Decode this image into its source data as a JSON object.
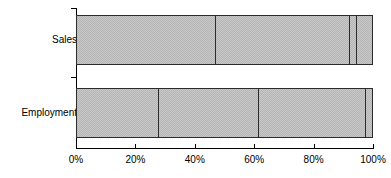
{
  "chart_data": {
    "type": "bar",
    "orientation": "horizontal",
    "stacked": true,
    "normalized": "100%",
    "title": "",
    "subtitle": "",
    "xlabel": "",
    "ylabel": "",
    "categories": [
      "Sales",
      "Employment"
    ],
    "xlim": [
      0,
      100
    ],
    "xticks": [
      0,
      20,
      40,
      60,
      80,
      100
    ],
    "xtick_labels": [
      "0%",
      "20%",
      "40%",
      "60%",
      "80%",
      "100%"
    ],
    "grid": false,
    "legend": null,
    "legend_position": "none",
    "annotations": [],
    "series": [
      {
        "name": "Segment 1",
        "values": [
          47.0,
          27.7
        ]
      },
      {
        "name": "Segment 2",
        "values": [
          45.5,
          34.1
        ]
      },
      {
        "name": "Segment 3",
        "values": [
          2.5,
          36.2
        ]
      },
      {
        "name": "Segment 4",
        "values": [
          5.0,
          2.0
        ]
      }
    ],
    "bars": [
      {
        "category": "Sales",
        "segments": [
          {
            "start": 0.0,
            "end": 47.0,
            "size": 47.0,
            "fill": "#c9c9c9"
          },
          {
            "start": 47.0,
            "end": 92.5,
            "size": 45.5,
            "fill": "#c9c9c9"
          },
          {
            "start": 92.5,
            "end": 95.0,
            "size": 2.5,
            "fill": "#c9c9c9"
          },
          {
            "start": 95.0,
            "end": 100.0,
            "size": 5.0,
            "fill": "#c9c9c9"
          }
        ]
      },
      {
        "category": "Employment",
        "segments": [
          {
            "start": 0.0,
            "end": 27.7,
            "size": 27.7,
            "fill": "#c9c9c9"
          },
          {
            "start": 27.7,
            "end": 61.8,
            "size": 34.1,
            "fill": "#c9c9c9"
          },
          {
            "start": 61.8,
            "end": 98.0,
            "size": 36.2,
            "fill": "#c9c9c9"
          },
          {
            "start": 98.0,
            "end": 100.0,
            "size": 2.0,
            "fill": "#c9c9c9"
          }
        ]
      }
    ],
    "colors": {
      "fill": "#c9c9c9",
      "pattern": "#b4b4b4",
      "outline": "#2b2b2b",
      "axis": "#000000",
      "text": "#000000",
      "background": "#ffffff"
    }
  }
}
